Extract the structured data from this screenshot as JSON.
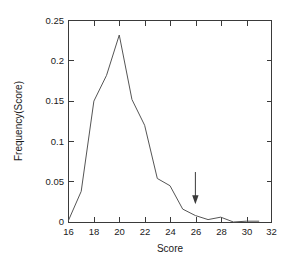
{
  "chart_data": {
    "type": "line",
    "title": "",
    "subtitle": "",
    "xlabel": "Score",
    "ylabel": "Frequency(Score)",
    "xlim": [
      16,
      32
    ],
    "ylim": [
      0,
      0.25
    ],
    "grid": false,
    "legend": null,
    "xticks": [
      16,
      18,
      20,
      22,
      24,
      26,
      28,
      30,
      32
    ],
    "xtick_labels": [
      "16",
      "18",
      "20",
      "22",
      "24",
      "26",
      "28",
      "30",
      "32"
    ],
    "yticks": [
      0,
      0.05,
      0.1,
      0.15,
      0.2,
      0.25
    ],
    "ytick_labels": [
      "0",
      "0.05",
      "0.1",
      "0.15",
      "0.2",
      "0.25"
    ],
    "x": [
      16,
      17,
      18,
      19,
      20,
      21,
      22,
      23,
      24,
      25,
      26,
      27,
      28,
      29,
      30,
      31
    ],
    "values": [
      0.002,
      0.038,
      0.15,
      0.182,
      0.232,
      0.152,
      0.12,
      0.054,
      0.045,
      0.016,
      0.008,
      0.003,
      0.006,
      0.0,
      0.001,
      0.001
    ],
    "series": [
      {
        "name": "Frequency(Score)",
        "color": "#555555",
        "values": [
          0.002,
          0.038,
          0.15,
          0.182,
          0.232,
          0.152,
          0.12,
          0.054,
          0.045,
          0.016,
          0.008,
          0.003,
          0.006,
          0.0,
          0.001,
          0.001
        ]
      }
    ],
    "peak_x": 20,
    "peak_y": 0.232,
    "annotations": [
      {
        "type": "arrow",
        "label": "",
        "direction": "down",
        "x": 26,
        "y_tip": 0.022,
        "y_tail": 0.062,
        "color": "#3a3a3a"
      }
    ]
  },
  "figure": {
    "background_color": "#ffffff",
    "frame_color": "#3a3a3a",
    "text_color": "#1a1a1a"
  }
}
